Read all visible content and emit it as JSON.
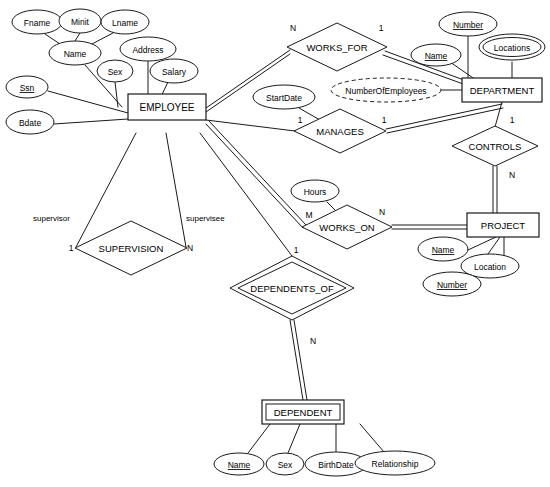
{
  "diagram": {
    "notation": "Chen ER notation",
    "colors": {
      "stroke": "#1a1a1a",
      "background": "#ffffff",
      "text": "#000000"
    }
  },
  "entities": [
    {
      "id": "employee",
      "name": "EMPLOYEE",
      "kind": "strong",
      "x": 128,
      "y": 107,
      "w": 78,
      "h": 26
    },
    {
      "id": "department",
      "name": "DEPARTMENT",
      "kind": "strong",
      "x": 502,
      "y": 90,
      "w": 80,
      "h": 24
    },
    {
      "id": "project",
      "name": "PROJECT",
      "kind": "strong",
      "x": 503,
      "y": 225,
      "w": 72,
      "h": 24
    },
    {
      "id": "dependent",
      "name": "DEPENDENT",
      "kind": "weak",
      "x": 303,
      "y": 412,
      "w": 82,
      "h": 24
    }
  ],
  "relationships": [
    {
      "id": "works_for",
      "name": "WORKS_FOR",
      "kind": "strong",
      "x": 337,
      "y": 47,
      "rx": 50,
      "ry": 24
    },
    {
      "id": "manages",
      "name": "MANAGES",
      "kind": "strong",
      "x": 340,
      "y": 131,
      "rx": 46,
      "ry": 22
    },
    {
      "id": "controls",
      "name": "CONTROLS",
      "kind": "strong",
      "x": 495,
      "y": 146,
      "rx": 43,
      "ry": 20
    },
    {
      "id": "works_on",
      "name": "WORKS_ON",
      "kind": "strong",
      "x": 347,
      "y": 227,
      "rx": 45,
      "ry": 22
    },
    {
      "id": "supervision",
      "name": "SUPERVISION",
      "kind": "strong",
      "x": 131,
      "y": 248,
      "rx": 56,
      "ry": 27
    },
    {
      "id": "dependents_of",
      "name": "DEPENDENTS_OF",
      "kind": "identifying",
      "x": 292,
      "y": 288,
      "rx": 62,
      "ry": 32
    }
  ],
  "attributes": [
    {
      "id": "fname",
      "label": "Fname",
      "owner": "name",
      "type": "simple",
      "x": 37,
      "y": 22,
      "rx": 25,
      "ry": 12
    },
    {
      "id": "minit",
      "label": "Minit",
      "owner": "name",
      "type": "simple",
      "x": 80,
      "y": 21,
      "rx": 21,
      "ry": 12
    },
    {
      "id": "lname",
      "label": "Lname",
      "owner": "name",
      "type": "simple",
      "x": 125,
      "y": 22,
      "rx": 24,
      "ry": 12
    },
    {
      "id": "name_emp",
      "label": "Name",
      "owner": "employee",
      "type": "composite",
      "x": 75,
      "y": 53,
      "rx": 26,
      "ry": 12
    },
    {
      "id": "sex",
      "label": "Sex",
      "owner": "employee",
      "type": "simple",
      "x": 115,
      "y": 71,
      "rx": 18,
      "ry": 11
    },
    {
      "id": "address",
      "label": "Address",
      "owner": "employee",
      "type": "simple",
      "x": 148,
      "y": 49,
      "rx": 28,
      "ry": 12
    },
    {
      "id": "salary",
      "label": "Salary",
      "owner": "employee",
      "type": "simple",
      "x": 174,
      "y": 71,
      "rx": 24,
      "ry": 12
    },
    {
      "id": "ssn",
      "label": "Ssn",
      "owner": "employee",
      "type": "key",
      "x": 27,
      "y": 87,
      "rx": 21,
      "ry": 11
    },
    {
      "id": "bdate",
      "label": "Bdate",
      "owner": "employee",
      "type": "simple",
      "x": 30,
      "y": 122,
      "rx": 24,
      "ry": 12
    },
    {
      "id": "startdate",
      "label": "StartDate",
      "owner": "manages",
      "type": "simple",
      "x": 284,
      "y": 97,
      "rx": 31,
      "ry": 12
    },
    {
      "id": "numberofemployees",
      "label": "NumberOfEmployees",
      "owner": "department",
      "type": "derived",
      "x": 386,
      "y": 90,
      "rx": 55,
      "ry": 12
    },
    {
      "id": "dept_name",
      "label": "Name",
      "owner": "department",
      "type": "key",
      "x": 436,
      "y": 55,
      "rx": 25,
      "ry": 11
    },
    {
      "id": "dept_number",
      "label": "Number",
      "owner": "department",
      "type": "key",
      "x": 468,
      "y": 24,
      "rx": 29,
      "ry": 12
    },
    {
      "id": "locations",
      "label": "Locations",
      "owner": "department",
      "type": "multivalued",
      "x": 512,
      "y": 47,
      "rx": 33,
      "ry": 13
    },
    {
      "id": "hours",
      "label": "Hours",
      "owner": "works_on",
      "type": "simple",
      "x": 315,
      "y": 191,
      "rx": 24,
      "ry": 11
    },
    {
      "id": "proj_name",
      "label": "Name",
      "owner": "project",
      "type": "key",
      "x": 443,
      "y": 249,
      "rx": 25,
      "ry": 12
    },
    {
      "id": "proj_location",
      "label": "Location",
      "owner": "project",
      "type": "simple",
      "x": 490,
      "y": 266,
      "rx": 29,
      "ry": 12
    },
    {
      "id": "proj_number",
      "label": "Number",
      "owner": "project",
      "type": "key",
      "x": 452,
      "y": 284,
      "rx": 29,
      "ry": 12
    },
    {
      "id": "dep_name",
      "label": "Name",
      "owner": "dependent",
      "type": "partial-key",
      "x": 239,
      "y": 464,
      "rx": 25,
      "ry": 11
    },
    {
      "id": "dep_sex",
      "label": "Sex",
      "owner": "dependent",
      "type": "simple",
      "x": 285,
      "y": 464,
      "rx": 19,
      "ry": 11
    },
    {
      "id": "dep_birthdate",
      "label": "BirthDate",
      "owner": "dependent",
      "type": "simple",
      "x": 336,
      "y": 464,
      "rx": 31,
      "ry": 12
    },
    {
      "id": "dep_relationship",
      "label": "Relationship",
      "owner": "dependent",
      "type": "simple",
      "x": 395,
      "y": 463,
      "rx": 40,
      "ry": 12
    }
  ],
  "cardinalities": [
    {
      "id": "wf-emp",
      "label": "N",
      "x": 293,
      "y": 31
    },
    {
      "id": "wf-dept",
      "label": "1",
      "x": 381,
      "y": 31
    },
    {
      "id": "mg-emp",
      "label": "1",
      "x": 300,
      "y": 123
    },
    {
      "id": "mg-dept",
      "label": "1",
      "x": 384,
      "y": 123
    },
    {
      "id": "ct-dept",
      "label": "1",
      "x": 512,
      "y": 123
    },
    {
      "id": "ct-proj",
      "label": "N",
      "x": 512,
      "y": 178
    },
    {
      "id": "wo-emp",
      "label": "M",
      "x": 309,
      "y": 218
    },
    {
      "id": "wo-proj",
      "label": "N",
      "x": 382,
      "y": 215
    },
    {
      "id": "sv-supervisor",
      "label": "1",
      "x": 71,
      "y": 251
    },
    {
      "id": "sv-supervisee",
      "label": "N",
      "x": 190,
      "y": 251
    },
    {
      "id": "do-emp",
      "label": "1",
      "x": 296,
      "y": 253
    },
    {
      "id": "do-dep",
      "label": "N",
      "x": 313,
      "y": 344
    }
  ],
  "roles": [
    {
      "id": "role-supervisor",
      "label": "supervisor",
      "x": 33,
      "y": 221
    },
    {
      "id": "role-supervisee",
      "label": "supervisee",
      "x": 186,
      "y": 221
    }
  ],
  "caption": {
    "text": ""
  }
}
